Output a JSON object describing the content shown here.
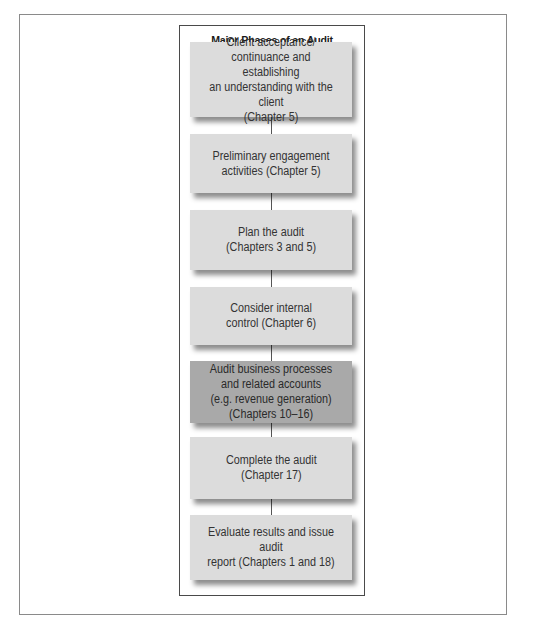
{
  "diagram": {
    "title": "Major Phases of an Audit",
    "highlight_color": "#a9a9a9",
    "box_color": "#dcdcdc",
    "phases": [
      {
        "label": "Client acceptance/\ncontinuance and establishing\nan understanding with the client\n(Chapter 5)",
        "highlighted": false
      },
      {
        "label": "Preliminary engagement\nactivities (Chapter 5)",
        "highlighted": false
      },
      {
        "label": "Plan the audit\n(Chapters 3 and 5)",
        "highlighted": false
      },
      {
        "label": "Consider internal\ncontrol (Chapter 6)",
        "highlighted": false
      },
      {
        "label": "Audit business processes\nand related accounts\n(e.g. revenue generation)\n(Chapters 10–16)",
        "highlighted": true
      },
      {
        "label": "Complete the audit\n(Chapter 17)",
        "highlighted": false
      },
      {
        "label": "Evaluate results and issue audit\nreport (Chapters 1 and 18)",
        "highlighted": false
      }
    ]
  }
}
